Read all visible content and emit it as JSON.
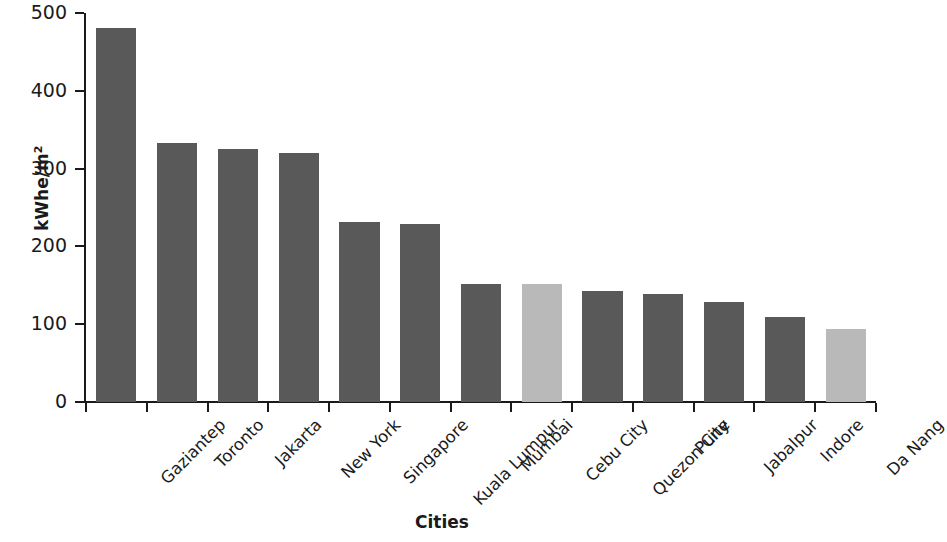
{
  "chart_data": {
    "type": "bar",
    "title": "",
    "xlabel": "Cities",
    "ylabel": "kWhe/m2",
    "ylabel_main": "kWhe/m",
    "ylabel_sup": "2",
    "categories": [
      "Gaziantep",
      "Toronto",
      "Jakarta",
      "New York",
      "Singapore",
      "Kuala Lumpur",
      "Mumbai",
      "Cebu City",
      "Quezon City",
      "Pune",
      "Jabalpur",
      "Indore",
      "Da Nang"
    ],
    "values": [
      481,
      333,
      325,
      320,
      232,
      229,
      152,
      152,
      143,
      139,
      129,
      109,
      94
    ],
    "bar_colors": [
      "#595959",
      "#595959",
      "#595959",
      "#595959",
      "#595959",
      "#595959",
      "#595959",
      "#b9b9b9",
      "#595959",
      "#595959",
      "#595959",
      "#595959",
      "#b9b9b9"
    ],
    "ylim": [
      0,
      500
    ],
    "yticks": [
      0,
      100,
      200,
      300,
      400,
      500
    ],
    "ytick_labels": [
      "0",
      "100",
      "200",
      "300",
      "400",
      "500"
    ],
    "grid": false,
    "legend": null,
    "colors": {
      "bar_dark": "#595959",
      "bar_light": "#b9b9b9",
      "axis": "#1a1a1a",
      "background": "#ffffff"
    }
  }
}
